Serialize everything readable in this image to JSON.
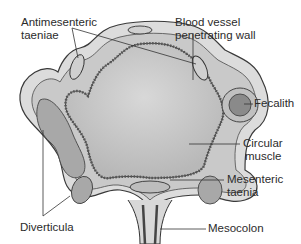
{
  "diagram": {
    "labels": {
      "antimesenteric_taeniae": [
        "Antimesenteric",
        "taeniae"
      ],
      "blood_vessel": [
        "Blood vessel",
        "penetrating wall"
      ],
      "fecalith": [
        "Fecalith"
      ],
      "circular_muscle": [
        "Circular",
        "muscle"
      ],
      "mesenteric_taenia": [
        "Mesenteric",
        "taenia"
      ],
      "diverticula": [
        "Diverticula"
      ],
      "mesocolon": [
        "Mesocolon"
      ]
    },
    "colors": {
      "outer_serosa": "#d9d9d9",
      "muscle_layer": "#c4c4c4",
      "lumen": "#c8c8c8",
      "outline": "#3a3a3a",
      "fecalith": "#8a8a8a",
      "leader_line": "#333333"
    }
  }
}
